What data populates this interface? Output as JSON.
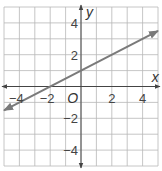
{
  "chart_data": {
    "type": "line",
    "title": "",
    "xlabel": "x",
    "ylabel": "y",
    "origin_label": "O",
    "xlim": [
      -5,
      5
    ],
    "ylim": [
      -5,
      5
    ],
    "grid": true,
    "x_ticks": [
      {
        "value": -4,
        "label": "−4"
      },
      {
        "value": -2,
        "label": "−2"
      },
      {
        "value": 2,
        "label": "2"
      },
      {
        "value": 4,
        "label": "4"
      }
    ],
    "y_ticks": [
      {
        "value": 4,
        "label": "4"
      },
      {
        "value": 2,
        "label": "2"
      },
      {
        "value": -2,
        "label": "−2"
      },
      {
        "value": -4,
        "label": "−4"
      }
    ],
    "series": [
      {
        "name": "line",
        "equation": "y = 0.5x + 1",
        "slope": 0.5,
        "intercept": 1,
        "x": [
          -5,
          5
        ],
        "y": [
          -1.5,
          3.5
        ],
        "arrows": "both",
        "color": "#7a7a7a"
      }
    ]
  }
}
